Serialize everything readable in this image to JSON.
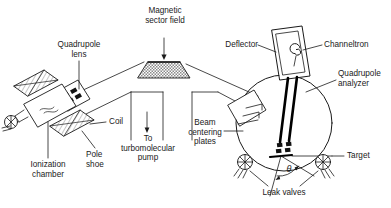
{
  "figure": {
    "type": "schematic-diagram",
    "colors": {
      "stroke": "#1a1a1a",
      "background": "#ffffff",
      "hatch_fill": "#9a9a9a",
      "rod_fill": "#000000"
    }
  },
  "labels": {
    "magnetic_sector_field": "Magnetic\nsector field",
    "quadrupole_lens": "Quadrupole\nlens",
    "deflector": "Deflector",
    "channeltron": "Channeltron",
    "quadrupole_analyzer": "Quadrupole\nanalyzer",
    "coil": "Coil",
    "pole_shoe": "Pole\nshoe",
    "ionization_chamber": "Ionization\nchamber",
    "to_turbomolecular_pump": "To\nturbomolecular\npump",
    "beam_centering_plates": "Beam\ncentering\nplates",
    "target": "Target",
    "leak_valves": "Leak valves",
    "theta_angle": "θ"
  },
  "components": [
    {
      "name": "magnetic-sector-field",
      "label": "Magnetic sector field",
      "shape": "hatched-hexagon"
    },
    {
      "name": "quadrupole-lens",
      "label": "Quadrupole lens",
      "shape": "four-electrode-block"
    },
    {
      "name": "pole-shoe",
      "label": "Pole shoe",
      "shape": "hatched-parallelogram"
    },
    {
      "name": "coil",
      "label": "Coil",
      "shape": "hatched-parallelogram"
    },
    {
      "name": "ionization-chamber",
      "label": "Ionization chamber",
      "shape": "tube-with-valve"
    },
    {
      "name": "turbomolecular-pump-port",
      "label": "To turbomolecular pump",
      "shape": "duct"
    },
    {
      "name": "beam-centering-plates",
      "label": "Beam centering plates",
      "shape": "tilted-plates"
    },
    {
      "name": "deflector",
      "label": "Deflector",
      "shape": "rectangular-box"
    },
    {
      "name": "channeltron",
      "label": "Channeltron",
      "shape": "spiral-in-box"
    },
    {
      "name": "quadrupole-analyzer",
      "label": "Quadrupole analyzer",
      "shape": "twin-rods"
    },
    {
      "name": "target",
      "label": "Target",
      "shape": "flat-bar"
    },
    {
      "name": "leak-valve-left",
      "label": "Leak valve",
      "shape": "crossed-circle-valve"
    },
    {
      "name": "leak-valve-right",
      "label": "Leak valve",
      "shape": "crossed-circle-valve"
    },
    {
      "name": "scattering-chamber",
      "label": "Scattering chamber",
      "shape": "circle"
    }
  ]
}
